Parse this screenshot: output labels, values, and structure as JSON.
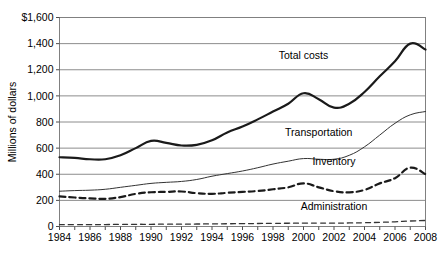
{
  "chart_data": {
    "type": "line",
    "title": "",
    "xlabel": "",
    "ylabel": "Millions of dollars",
    "xlim": [
      1984,
      2008
    ],
    "ylim": [
      0,
      1600
    ],
    "ytick_labels": [
      "$1,600",
      "1,400",
      "1,200",
      "1,000",
      "800",
      "600",
      "400",
      "200",
      "0"
    ],
    "ytick_values": [
      1600,
      1400,
      1200,
      1000,
      800,
      600,
      400,
      200,
      0
    ],
    "xtick_labels": [
      "1984",
      "1986",
      "1988",
      "1990",
      "1992",
      "1994",
      "1996",
      "1998",
      "2000",
      "2002",
      "2004",
      "2006",
      "2008"
    ],
    "xtick_values": [
      1984,
      1986,
      1988,
      1990,
      1992,
      1994,
      1996,
      1998,
      2000,
      2002,
      2004,
      2006,
      2008
    ],
    "x": [
      1984,
      1985,
      1986,
      1987,
      1988,
      1989,
      1990,
      1991,
      1992,
      1993,
      1994,
      1995,
      1996,
      1997,
      1998,
      1999,
      2000,
      2001,
      2002,
      2003,
      2004,
      2005,
      2006,
      2007,
      2008
    ],
    "grid": "horizontal",
    "legend": "inline-labels",
    "series": [
      {
        "name": "Total costs",
        "style": "solid-thick",
        "color": "#1a1a1a",
        "label_x": 2000,
        "label_y": 1285,
        "values": [
          530,
          525,
          515,
          515,
          545,
          600,
          655,
          640,
          620,
          625,
          660,
          720,
          765,
          820,
          880,
          940,
          1020,
          975,
          910,
          940,
          1030,
          1150,
          1265,
          1400,
          1355
        ]
      },
      {
        "name": "Transportation",
        "style": "solid-thin",
        "color": "#333333",
        "label_x": 2001,
        "label_y": 690,
        "values": [
          270,
          275,
          278,
          285,
          300,
          315,
          330,
          338,
          345,
          360,
          385,
          405,
          425,
          450,
          478,
          500,
          520,
          515,
          515,
          545,
          610,
          700,
          790,
          855,
          880
        ]
      },
      {
        "name": "Inventory",
        "style": "dashed-thick",
        "color": "#1a1a1a",
        "label_x": 2002,
        "label_y": 470,
        "values": [
          230,
          222,
          215,
          212,
          225,
          250,
          262,
          265,
          268,
          255,
          250,
          258,
          265,
          272,
          285,
          300,
          330,
          300,
          270,
          262,
          280,
          330,
          370,
          450,
          400
        ]
      },
      {
        "name": "Administration",
        "style": "dashed-thin",
        "color": "#333333",
        "label_x": 2002,
        "label_y": 125,
        "values": [
          14,
          14,
          14,
          15,
          16,
          17,
          17,
          18,
          18,
          19,
          20,
          21,
          22,
          23,
          24,
          25,
          26,
          26,
          26,
          27,
          29,
          32,
          36,
          42,
          46
        ]
      }
    ]
  }
}
